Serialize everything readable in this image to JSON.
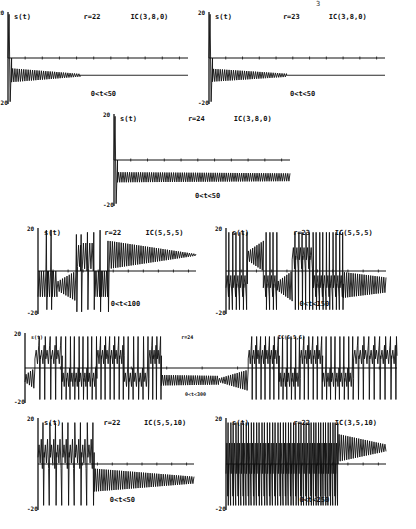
{
  "page_marker": "3",
  "chart_data": [
    {
      "type": "line",
      "title": "",
      "series_label": "s(t)",
      "param": "r=22",
      "ic": "IC(3,8,0)",
      "range": "0<t<50",
      "ylim": [
        -20,
        20
      ],
      "xlim": [
        0,
        50
      ],
      "box": {
        "x": 8,
        "y": 12,
        "w": 180,
        "h": 92,
        "yticks_x": 0
      },
      "baseline_y_frac": 0.45,
      "segments": [
        {
          "t0": 0,
          "t1": 1,
          "kind": "spike",
          "hi": 19,
          "lo": -19
        },
        {
          "t0": 1,
          "t1": 20,
          "kind": "decay",
          "center": -7.5,
          "amp0": 3,
          "amp1": 0.6,
          "freq": 2.2
        },
        {
          "t0": 20,
          "t1": 50,
          "kind": "flat",
          "center": -7.5
        }
      ]
    },
    {
      "type": "line",
      "series_label": "s(t)",
      "param": "r=23",
      "ic": "IC(3,8,0)",
      "range": "0<t<50",
      "ylim": [
        -20,
        20
      ],
      "xlim": [
        0,
        50
      ],
      "box": {
        "x": 209,
        "y": 12,
        "w": 176,
        "h": 92
      },
      "baseline_y_frac": 0.45,
      "segments": [
        {
          "t0": 0,
          "t1": 1,
          "kind": "spike",
          "hi": 19,
          "lo": -19
        },
        {
          "t0": 1,
          "t1": 22,
          "kind": "decay",
          "center": -7.5,
          "amp0": 2.8,
          "amp1": 0.7,
          "freq": 2.2
        },
        {
          "t0": 22,
          "t1": 50,
          "kind": "flat",
          "center": -7.5
        }
      ]
    },
    {
      "type": "line",
      "series_label": "s(t)",
      "param": "r=24",
      "ic": "IC(3,8,0)",
      "range": "0<t<50",
      "ylim": [
        -20,
        20
      ],
      "xlim": [
        0,
        50
      ],
      "box": {
        "x": 114,
        "y": 114,
        "w": 176,
        "h": 92
      },
      "baseline_y_frac": 0.45,
      "segments": [
        {
          "t0": 0,
          "t1": 1,
          "kind": "spike",
          "hi": 19,
          "lo": -19
        },
        {
          "t0": 1,
          "t1": 50,
          "kind": "decay",
          "center": -7.5,
          "amp0": 2.2,
          "amp1": 1.7,
          "freq": 2.2
        }
      ]
    },
    {
      "type": "line",
      "series_label": "s(t)",
      "param": "r=22",
      "ic": "IC(5,5,5)",
      "range": "0<t<100",
      "ylim": [
        -20,
        20
      ],
      "xlim": [
        0,
        100
      ],
      "box": {
        "x": 38,
        "y": 228,
        "w": 158,
        "h": 86
      },
      "baseline_y_frac": 0.5,
      "segments": [
        {
          "t0": 0,
          "t1": 5,
          "kind": "osc",
          "center": -6,
          "amp": 6
        },
        {
          "t0": 5,
          "t1": 6,
          "kind": "spike",
          "hi": 19,
          "lo": -18
        },
        {
          "t0": 6,
          "t1": 8,
          "kind": "osc",
          "center": -6,
          "amp": 6
        },
        {
          "t0": 8,
          "t1": 9,
          "kind": "spike",
          "hi": 19,
          "lo": -18
        },
        {
          "t0": 9,
          "t1": 12,
          "kind": "osc",
          "center": -6,
          "amp": 6
        },
        {
          "t0": 12,
          "t1": 24,
          "kind": "grow",
          "center": -7,
          "amp0": 2,
          "amp1": 7
        },
        {
          "t0": 24,
          "t1": 25,
          "kind": "spike",
          "hi": 17,
          "lo": -19
        },
        {
          "t0": 25,
          "t1": 27,
          "kind": "osc",
          "center": 7,
          "amp": 5
        },
        {
          "t0": 27,
          "t1": 28,
          "kind": "spike",
          "hi": 17,
          "lo": -19
        },
        {
          "t0": 28,
          "t1": 31,
          "kind": "osc",
          "center": 7,
          "amp": 6
        },
        {
          "t0": 31,
          "t1": 32,
          "kind": "spike",
          "hi": 18,
          "lo": -18
        },
        {
          "t0": 32,
          "t1": 35,
          "kind": "osc",
          "center": 7,
          "amp": 6
        },
        {
          "t0": 35,
          "t1": 36,
          "kind": "spike",
          "hi": 18,
          "lo": -18
        },
        {
          "t0": 36,
          "t1": 39,
          "kind": "osc",
          "center": -6,
          "amp": 6
        },
        {
          "t0": 39,
          "t1": 40,
          "kind": "spike",
          "hi": 19,
          "lo": -19
        },
        {
          "t0": 40,
          "t1": 44,
          "kind": "osc",
          "center": -6,
          "amp": 6
        },
        {
          "t0": 44,
          "t1": 45,
          "kind": "spike",
          "hi": 14,
          "lo": -19
        },
        {
          "t0": 45,
          "t1": 100,
          "kind": "decay",
          "center": 7.5,
          "amp0": 6.5,
          "amp1": 0.4,
          "freq": 5
        }
      ]
    },
    {
      "type": "line",
      "series_label": "s(t)",
      "param": "r=23",
      "ic": "IC(5,5,5)",
      "range": "0<t<150",
      "ylim": [
        -20,
        20
      ],
      "xlim": [
        0,
        150
      ],
      "box": {
        "x": 226,
        "y": 228,
        "w": 160,
        "h": 86
      },
      "baseline_y_frac": 0.5,
      "segments": [
        {
          "t0": 0,
          "t1": 20,
          "kind": "bursts",
          "n": 6,
          "center": -6,
          "amp": 6
        },
        {
          "t0": 20,
          "t1": 35,
          "kind": "decay",
          "center": 7,
          "amp0": 2,
          "amp1": 7,
          "freq": 5
        },
        {
          "t0": 35,
          "t1": 48,
          "kind": "bursts",
          "n": 4,
          "center": -6,
          "amp": 6
        },
        {
          "t0": 48,
          "t1": 62,
          "kind": "grow",
          "center": -7,
          "amp0": 2,
          "amp1": 7
        },
        {
          "t0": 62,
          "t1": 82,
          "kind": "bursts",
          "n": 6,
          "center": 7,
          "amp": 6
        },
        {
          "t0": 82,
          "t1": 110,
          "kind": "bursts",
          "n": 9,
          "center": -6,
          "amp": 6
        },
        {
          "t0": 110,
          "t1": 150,
          "kind": "decay",
          "center": -6.5,
          "amp0": 6,
          "amp1": 3.5,
          "freq": 5
        }
      ]
    },
    {
      "type": "line",
      "series_label": "s(t)",
      "param": "r=24",
      "ic": "IC(5,5,5)",
      "range": "0<t<300",
      "ylim": [
        -20,
        20
      ],
      "xlim": [
        0,
        300
      ],
      "box": {
        "x": 25,
        "y": 333,
        "w": 372,
        "h": 70
      },
      "baseline_y_frac": 0.48,
      "small_labels": true,
      "segments": [
        {
          "t0": 0,
          "t1": 8,
          "kind": "grow",
          "center": -6,
          "amp0": 2,
          "amp1": 6
        },
        {
          "t0": 8,
          "t1": 30,
          "kind": "bursts",
          "n": 5,
          "center": 7,
          "amp": 6
        },
        {
          "t0": 30,
          "t1": 58,
          "kind": "bursts",
          "n": 8,
          "center": -6,
          "amp": 6
        },
        {
          "t0": 58,
          "t1": 80,
          "kind": "bursts",
          "n": 6,
          "center": 7,
          "amp": 6
        },
        {
          "t0": 80,
          "t1": 100,
          "kind": "bursts",
          "n": 5,
          "center": -6,
          "amp": 6
        },
        {
          "t0": 100,
          "t1": 110,
          "kind": "bursts",
          "n": 3,
          "center": 7,
          "amp": 6
        },
        {
          "t0": 110,
          "t1": 156,
          "kind": "decay",
          "center": -7,
          "amp0": 3,
          "amp1": 2.5,
          "freq": 5
        },
        {
          "t0": 156,
          "t1": 180,
          "kind": "grow",
          "center": -7,
          "amp0": 1,
          "amp1": 6
        },
        {
          "t0": 180,
          "t1": 205,
          "kind": "bursts",
          "n": 7,
          "center": 7,
          "amp": 6
        },
        {
          "t0": 205,
          "t1": 222,
          "kind": "bursts",
          "n": 5,
          "center": -6,
          "amp": 6
        },
        {
          "t0": 222,
          "t1": 240,
          "kind": "bursts",
          "n": 5,
          "center": 7,
          "amp": 6
        },
        {
          "t0": 240,
          "t1": 265,
          "kind": "bursts",
          "n": 7,
          "center": -6,
          "amp": 6
        },
        {
          "t0": 265,
          "t1": 300,
          "kind": "bursts",
          "n": 8,
          "center": 7,
          "amp": 6
        }
      ]
    },
    {
      "type": "line",
      "series_label": "s(t)",
      "param": "r=22",
      "ic": "IC(5,5,10)",
      "range": "0<t<50",
      "ylim": [
        -20,
        20
      ],
      "xlim": [
        0,
        50
      ],
      "box": {
        "x": 38,
        "y": 418,
        "w": 156,
        "h": 92
      },
      "baseline_y_frac": 0.5,
      "segments": [
        {
          "t0": 0,
          "t1": 18,
          "kind": "bursts",
          "n": 9,
          "center": 5,
          "amp": 7
        },
        {
          "t0": 18,
          "t1": 50,
          "kind": "decay",
          "center": -7,
          "amp0": 5,
          "amp1": 1.5,
          "freq": 4
        }
      ]
    },
    {
      "type": "line",
      "series_label": "s(t)",
      "param": "r=22",
      "ic": "IC(3,5,10)",
      "range": "0<t<250",
      "ylim": [
        -20,
        20
      ],
      "xlim": [
        0,
        250
      ],
      "box": {
        "x": 226,
        "y": 418,
        "w": 160,
        "h": 92
      },
      "baseline_y_frac": 0.5,
      "segments": [
        {
          "t0": 0,
          "t1": 40,
          "kind": "bursts",
          "n": 10,
          "center": 0,
          "amp": 14
        },
        {
          "t0": 40,
          "t1": 90,
          "kind": "bursts",
          "n": 12,
          "center": 0,
          "amp": 14
        },
        {
          "t0": 90,
          "t1": 130,
          "kind": "bursts",
          "n": 10,
          "center": 0,
          "amp": 14
        },
        {
          "t0": 130,
          "t1": 175,
          "kind": "bursts",
          "n": 12,
          "center": 0,
          "amp": 14
        },
        {
          "t0": 175,
          "t1": 250,
          "kind": "decay",
          "center": 7,
          "amp0": 6,
          "amp1": 1.5,
          "freq": 5
        }
      ]
    }
  ]
}
